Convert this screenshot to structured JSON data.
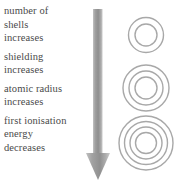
{
  "diagram": {
    "accent_color": "#9a9a9a",
    "text_color": "#4a4a4a",
    "shell_color": "#a8a8a8"
  },
  "trends": [
    {
      "name": "number-of-shells",
      "lines": [
        "number of",
        "shells",
        "increases"
      ]
    },
    {
      "name": "shielding",
      "lines": [
        "shielding",
        "increases"
      ]
    },
    {
      "name": "atomic-radius",
      "lines": [
        "atomic radius",
        "increases"
      ]
    },
    {
      "name": "first-ionisation-energy",
      "lines": [
        "first ionisation",
        "energy",
        "decreases"
      ]
    }
  ],
  "arrow": {
    "direction": "down",
    "label": "increasing down group"
  },
  "atoms": [
    {
      "name": "atom-2-shells",
      "shells": 2,
      "diameter": 36
    },
    {
      "name": "atom-3-shells",
      "shells": 3,
      "diameter": 46
    },
    {
      "name": "atom-4-shells",
      "shells": 4,
      "diameter": 54
    }
  ]
}
